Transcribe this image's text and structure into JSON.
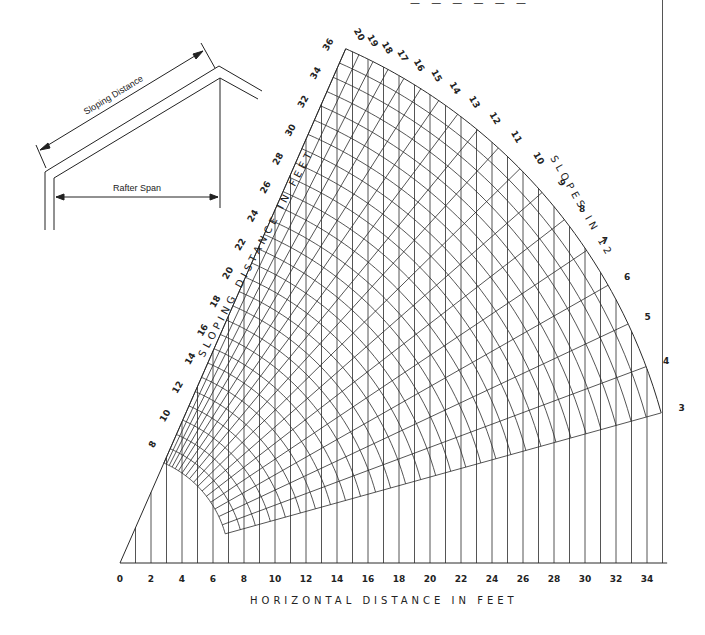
{
  "header": {
    "partial_title_text": "— — — — — —"
  },
  "inset": {
    "sloping_distance_label": "Sloping Distance",
    "rafter_span_label": "Rafter Span"
  },
  "axes": {
    "x_title": "HORIZONTAL   DISTANCE   IN   FEET",
    "radial_title": "SLOPING   DISTANCE   IN   FEET",
    "slope_title": "SLOPES   IN   12"
  },
  "chart_data": {
    "type": "diagram",
    "xlabel": "HORIZONTAL DISTANCE IN FEET",
    "radial_label": "SLOPING DISTANCE IN FEET",
    "angular_label": "SLOPES IN 12",
    "x_ticks": [
      0,
      2,
      4,
      6,
      8,
      10,
      12,
      14,
      16,
      18,
      20,
      22,
      24,
      26,
      28,
      30,
      32,
      34
    ],
    "x_range": [
      0,
      35
    ],
    "sloping_distance_ticks": [
      8,
      10,
      12,
      14,
      16,
      18,
      20,
      22,
      24,
      26,
      28,
      30,
      32,
      34,
      36
    ],
    "sloping_distance_range": [
      7,
      36
    ],
    "slopes_in_12": [
      20,
      19,
      18,
      17,
      16,
      15,
      14,
      13,
      12,
      11,
      10,
      9,
      8,
      7,
      6,
      5,
      4,
      3
    ],
    "grid": true
  }
}
